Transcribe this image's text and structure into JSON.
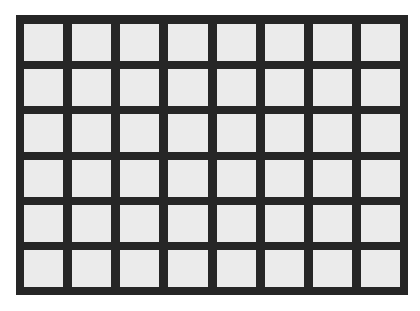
{
  "grid": {
    "rows": 6,
    "columns": 8,
    "colors": {
      "background": "#ffffff",
      "frame": "#262626",
      "cell": "#ebebeb"
    }
  }
}
